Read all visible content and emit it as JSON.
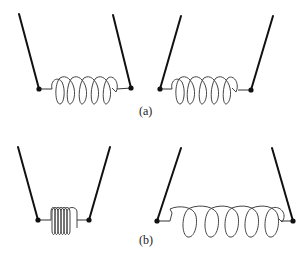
{
  "figure": {
    "panels": [
      {
        "id": "a",
        "label": "(a)",
        "description": "Two springs of equal natural length hung between slanted supports; left shown slightly compressed, right slightly stretched",
        "springs": [
          {
            "name": "spring-a-left",
            "coils": 5,
            "state": "natural"
          },
          {
            "name": "spring-a-right",
            "coils": 5,
            "state": "natural"
          }
        ]
      },
      {
        "id": "b",
        "label": "(b)",
        "description": "Left spring compressed between converging supports; right spring stretched between diverging supports",
        "springs": [
          {
            "name": "spring-b-left",
            "coils": 6,
            "state": "compressed"
          },
          {
            "name": "spring-b-right",
            "coils": 6,
            "state": "stretched"
          }
        ]
      }
    ]
  }
}
